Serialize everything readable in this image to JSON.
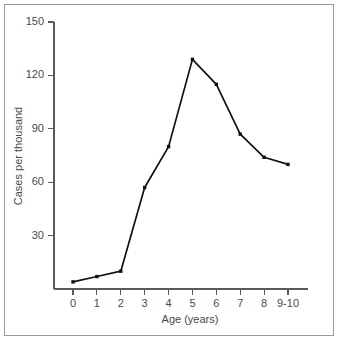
{
  "chart_data": {
    "type": "line",
    "title": "",
    "subtitle": "",
    "xlabel": "Age (years)",
    "ylabel": "Cases per thousand",
    "categories": [
      "0",
      "1",
      "2",
      "3",
      "4",
      "5",
      "6",
      "7",
      "8",
      "9-10"
    ],
    "values": [
      4,
      7,
      10,
      57,
      80,
      129,
      115,
      87,
      74,
      70
    ],
    "series": [
      {
        "name": "Cases per thousand",
        "values": [
          4,
          7,
          10,
          57,
          80,
          129,
          115,
          87,
          74,
          70
        ]
      }
    ],
    "x_tick_labels": [
      "0",
      "1",
      "2",
      "3",
      "4",
      "5",
      "6",
      "7",
      "8",
      "9-10"
    ],
    "y_tick_labels": [
      "30",
      "60",
      "90",
      "120",
      "150"
    ],
    "y_tick_values": [
      30,
      60,
      90,
      120,
      150
    ],
    "ylim": [
      0,
      150
    ],
    "xlim": [
      0,
      9
    ],
    "grid": false,
    "legend": false,
    "legend_position": "none",
    "marker": "square",
    "line_color": "#111111",
    "marker_color": "#111111",
    "axis_color": "#5a5a5a",
    "text_color": "#4a4a4a",
    "background_color": "#ffffff",
    "frame_border_color": "#9a9a9a",
    "annotations": []
  },
  "figure": {
    "border_label": "figure-border"
  }
}
